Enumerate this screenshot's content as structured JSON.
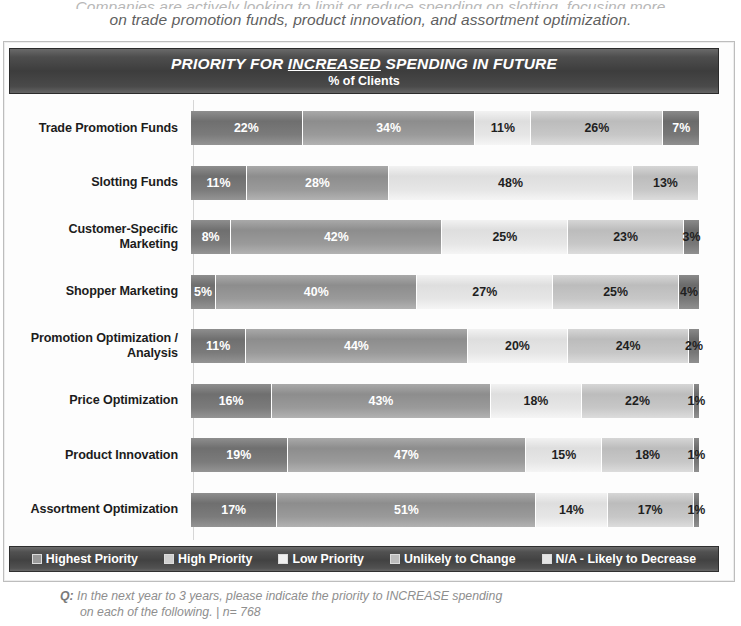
{
  "intro": {
    "line1": "Companies are actively looking to limit or reduce spending on slotting, focusing more",
    "line2": "on trade promotion funds, product innovation, and assortment optimization."
  },
  "title": {
    "main_before": "PRIORITY FOR ",
    "main_underlined": "INCREASED",
    "main_after": " SPENDING IN FUTURE",
    "subtitle": "% of Clients"
  },
  "legend": {
    "items": [
      {
        "label": "Highest Priority",
        "swatch": "legend-swatch-highest-priority"
      },
      {
        "label": "High Priority",
        "swatch": "legend-swatch-high-priority"
      },
      {
        "label": "Low Priority",
        "swatch": "legend-swatch-low-priority"
      },
      {
        "label": "Unlikely to Change",
        "swatch": "legend-swatch-unlikely-to-change"
      },
      {
        "label": "N/A - Likely to Decrease",
        "swatch": "legend-swatch-na-likely-to-decrease"
      }
    ]
  },
  "footnote": {
    "q_marker": "Q:",
    "line1": "In the next year to 3 years, please indicate the priority to INCREASE spending",
    "line2": "on each of the following. | n= 768"
  },
  "chart_data": {
    "type": "bar",
    "subtype": "stacked-horizontal-100",
    "title": "PRIORITY FOR INCREASED SPENDING IN FUTURE",
    "subtitle": "% of Clients",
    "xlabel": "",
    "ylabel": "",
    "xlim": [
      0,
      100
    ],
    "grid": false,
    "legend_position": "bottom",
    "value_suffix": "%",
    "categories": [
      "Trade Promotion Funds",
      "Slotting Funds",
      "Customer-Specific Marketing",
      "Shopper Marketing",
      "Promotion Optimization / Analysis",
      "Price Optimization",
      "Product Innovation",
      "Assortment Optimization"
    ],
    "series": [
      {
        "name": "Highest Priority",
        "values": [
          22,
          11,
          8,
          5,
          11,
          16,
          19,
          17
        ]
      },
      {
        "name": "High Priority",
        "values": [
          34,
          28,
          42,
          40,
          44,
          43,
          47,
          51
        ]
      },
      {
        "name": "Low Priority",
        "values": [
          11,
          48,
          25,
          27,
          20,
          18,
          15,
          14
        ]
      },
      {
        "name": "Unlikely to Change",
        "values": [
          26,
          13,
          23,
          25,
          24,
          22,
          18,
          17
        ]
      },
      {
        "name": "N/A - Likely to Decrease",
        "values": [
          7,
          0,
          3,
          4,
          2,
          1,
          1,
          1
        ]
      }
    ],
    "rows": [
      {
        "label": "Trade Promotion Funds",
        "label_lines": [
          "Trade Promotion Funds"
        ],
        "segments": [
          22,
          34,
          11,
          26,
          7
        ]
      },
      {
        "label": "Slotting Funds",
        "label_lines": [
          "Slotting Funds"
        ],
        "segments": [
          11,
          28,
          48,
          13,
          0
        ]
      },
      {
        "label": "Customer-Specific Marketing",
        "label_lines": [
          "Customer-Specific",
          "Marketing"
        ],
        "segments": [
          8,
          42,
          25,
          23,
          3
        ]
      },
      {
        "label": "Shopper Marketing",
        "label_lines": [
          "Shopper Marketing"
        ],
        "segments": [
          5,
          40,
          27,
          25,
          4
        ]
      },
      {
        "label": "Promotion Optimization / Analysis",
        "label_lines": [
          "Promotion Optimization /",
          "Analysis"
        ],
        "segments": [
          11,
          44,
          20,
          24,
          2
        ]
      },
      {
        "label": "Price Optimization",
        "label_lines": [
          "Price Optimization"
        ],
        "segments": [
          16,
          43,
          18,
          22,
          1
        ]
      },
      {
        "label": "Product Innovation",
        "label_lines": [
          "Product Innovation"
        ],
        "segments": [
          19,
          47,
          15,
          18,
          1
        ]
      },
      {
        "label": "Assortment Optimization",
        "label_lines": [
          "Assortment Optimization"
        ],
        "segments": [
          17,
          51,
          14,
          17,
          1
        ]
      }
    ]
  }
}
